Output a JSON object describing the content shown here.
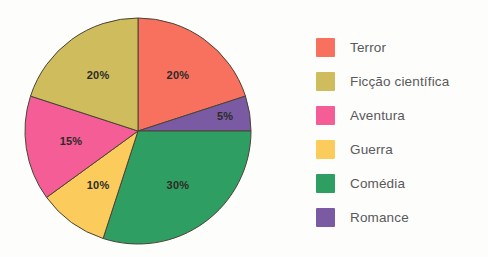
{
  "chart_data": {
    "type": "pie",
    "title": "",
    "subtitle": "",
    "xlabel": "",
    "ylabel": "",
    "grid": false,
    "legend_position": "right",
    "start_angle_deg": 0,
    "direction": "clockwise",
    "categories": [
      "Terror",
      "Ficção científica",
      "Aventura",
      "Guerra",
      "Comédia",
      "Romance"
    ],
    "values": [
      20,
      20,
      15,
      10,
      30,
      5
    ],
    "value_unit": "%",
    "data_labels": [
      "20%",
      "20%",
      "15%",
      "10%",
      "30%",
      "5%"
    ],
    "colors": [
      "#f8715e",
      "#cfbc5c",
      "#f45d96",
      "#fbcc5c",
      "#2f9e63",
      "#7a5ba3"
    ],
    "slices": [
      {
        "label": "Terror",
        "value": 20,
        "data_label": "20%",
        "color": "#f8715e",
        "start_deg": 0,
        "end_deg": 72
      },
      {
        "label": "Romance",
        "value": 5,
        "data_label": "5%",
        "color": "#7a5ba3",
        "start_deg": 72,
        "end_deg": 90
      },
      {
        "label": "Comédia",
        "value": 30,
        "data_label": "30%",
        "color": "#2f9e63",
        "start_deg": 90,
        "end_deg": 198
      },
      {
        "label": "Guerra",
        "value": 10,
        "data_label": "10%",
        "color": "#fbcc5c",
        "start_deg": 198,
        "end_deg": 234
      },
      {
        "label": "Aventura",
        "value": 15,
        "data_label": "15%",
        "color": "#f45d96",
        "start_deg": 234,
        "end_deg": 288
      },
      {
        "label": "Ficção científica",
        "value": 20,
        "data_label": "20%",
        "color": "#cfbc5c",
        "start_deg": 288,
        "end_deg": 360
      }
    ]
  },
  "legend": {
    "items": [
      {
        "label": "Terror",
        "color": "#f8715e"
      },
      {
        "label": "Ficção científica",
        "color": "#cfbc5c"
      },
      {
        "label": "Aventura",
        "color": "#f45d96"
      },
      {
        "label": "Guerra",
        "color": "#fbcc5c"
      },
      {
        "label": "Comédia",
        "color": "#2f9e63"
      },
      {
        "label": "Romance",
        "color": "#7a5ba3"
      }
    ]
  },
  "style": {
    "background": "#fdfdfb",
    "slice_outline": "#4a4436",
    "label_text_color": "#2b2b26",
    "legend_text_color": "#59595b"
  },
  "geometry": {
    "center_x": 138,
    "center_y": 131,
    "radius": 113
  }
}
